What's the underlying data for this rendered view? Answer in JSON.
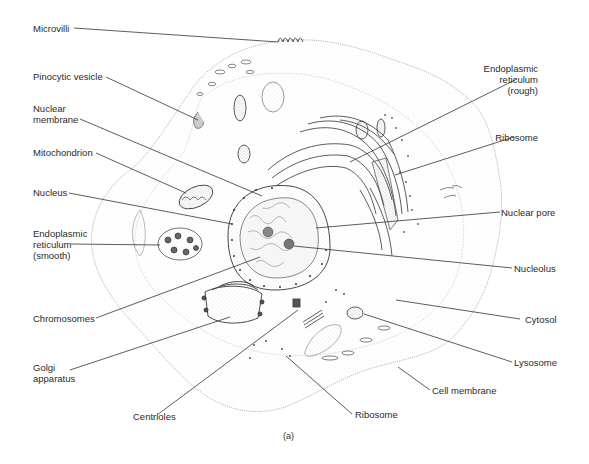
{
  "figure": {
    "caption": "(a)"
  },
  "labels": {
    "left": [
      {
        "id": "microvilli",
        "text": "Microvilli"
      },
      {
        "id": "pinocytic_vesicle",
        "text": "Pinocytic vesicle"
      },
      {
        "id": "nuclear_membrane",
        "text": "Nuclear\nmembrane"
      },
      {
        "id": "mitochondrion",
        "text": "Mitochondrion"
      },
      {
        "id": "nucleus",
        "text": "Nucleus"
      },
      {
        "id": "er_smooth",
        "text": "Endoplasmic\nreticulum\n(smooth)"
      },
      {
        "id": "chromosomes",
        "text": "Chromosomes"
      },
      {
        "id": "golgi",
        "text": "Golgi\napparatus"
      },
      {
        "id": "centrioles",
        "text": "Centrioles"
      }
    ],
    "right": [
      {
        "id": "er_rough",
        "text": "Endoplasmic\nreticulum\n(rough)"
      },
      {
        "id": "ribosome_top",
        "text": "Ribosome"
      },
      {
        "id": "nuclear_pore",
        "text": "Nuclear pore"
      },
      {
        "id": "nucleolus",
        "text": "Nucleolus"
      },
      {
        "id": "cytosol",
        "text": "Cytosol"
      },
      {
        "id": "lysosome",
        "text": "Lysosome"
      },
      {
        "id": "cell_membrane",
        "text": "Cell membrane"
      },
      {
        "id": "ribosome_bottom",
        "text": "Ribosome"
      }
    ]
  },
  "colors": {
    "ink": "#2a2a2a",
    "stipple": "#9a9a9a",
    "background": "#ffffff"
  }
}
